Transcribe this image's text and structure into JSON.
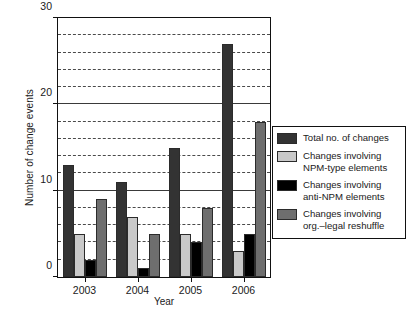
{
  "chart_data": {
    "type": "bar",
    "title": "",
    "xlabel": "Year",
    "ylabel": "Number of change events",
    "categories": [
      "2003",
      "2004",
      "2005",
      "2006"
    ],
    "ylim": [
      0,
      30
    ],
    "yticks": [
      0,
      10,
      20,
      30
    ],
    "ytick_labels": [
      "0",
      "10",
      "20",
      "30"
    ],
    "minor_gridline_interval": 2,
    "grid": true,
    "legend_position": "right",
    "series": [
      {
        "name": "Total no. of changes",
        "label_line1": "Total no. of changes",
        "label_line2": "",
        "color": "#333333",
        "values": [
          13,
          11,
          15,
          27
        ]
      },
      {
        "name": "Changes involving NPM-type elements",
        "label_line1": "Changes involving",
        "label_line2": "NPM-type elements",
        "color": "#c9c9c9",
        "values": [
          5,
          7,
          5,
          3
        ]
      },
      {
        "name": "Changes involving anti-NPM elements",
        "label_line1": "Changes involving",
        "label_line2": "anti-NPM elements",
        "color": "#000000",
        "values": [
          2,
          1,
          4,
          5
        ]
      },
      {
        "name": "Changes involving org.–legal reshuffle",
        "label_line1": "Changes involving",
        "label_line2": "org.–legal reshuffle",
        "color": "#6e6e6e",
        "values": [
          9,
          5,
          8,
          18
        ]
      }
    ]
  },
  "legend": {
    "items": [
      {
        "label": "Total no. of changes"
      },
      {
        "label": "Changes involving\nNPM-type elements"
      },
      {
        "label": "Changes involving\nanti-NPM elements"
      },
      {
        "label": "Changes involving\norg.–legal reshuffle"
      }
    ]
  },
  "axes": {
    "y_title": "Number of change events",
    "x_title": "Year"
  }
}
